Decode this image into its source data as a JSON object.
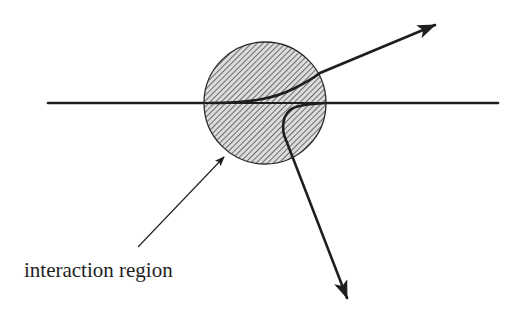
{
  "diagram": {
    "label_interaction_region": "interaction region",
    "colors": {
      "background": "#ffffff",
      "stroke": "#1e1e1e",
      "hatch_fill": "#d9d9d9",
      "hatch_line": "#444444"
    },
    "elements": {
      "incoming_line": "horizontal incoming trajectory",
      "region": "hatched circular interaction region",
      "outgoing_up": "deflected trajectory arrow (upper right)",
      "outgoing_down": "deflected trajectory arrow (lower right)",
      "pointer": "annotation arrow to interaction region"
    }
  }
}
